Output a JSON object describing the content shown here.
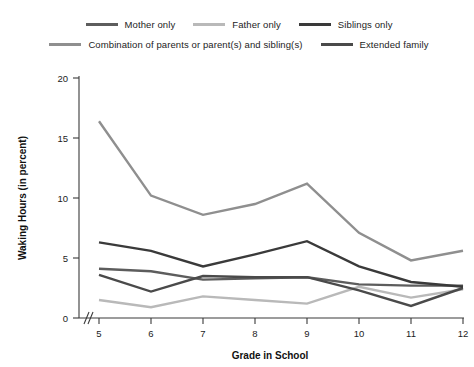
{
  "chart_data": {
    "type": "line",
    "title": "",
    "xlabel": "Grade in School",
    "ylabel": "Waking Hours (in percent)",
    "categories": [
      "5",
      "6",
      "7",
      "8",
      "9",
      "10",
      "11",
      "12"
    ],
    "x": [
      5,
      6,
      7,
      8,
      9,
      10,
      11,
      12
    ],
    "xlim": [
      5,
      12
    ],
    "ylim": [
      0,
      20
    ],
    "yticks": [
      "0",
      "5",
      "10",
      "15",
      "20"
    ],
    "ytick_values": [
      0,
      5,
      10,
      15,
      20
    ],
    "grid": false,
    "legend_position": "top",
    "axis_break": "x-axis break between origin and grade 5",
    "series": [
      {
        "name": "Mother only",
        "color": "#5d5d5d",
        "values": [
          4.1,
          3.9,
          3.2,
          3.3,
          3.4,
          2.8,
          2.7,
          2.7
        ]
      },
      {
        "name": "Father only",
        "color": "#b9b9b9",
        "values": [
          1.5,
          0.9,
          1.8,
          1.5,
          1.2,
          2.6,
          1.7,
          2.4
        ]
      },
      {
        "name": "Siblings only",
        "color": "#3a3a3a",
        "values": [
          6.3,
          5.6,
          4.3,
          5.3,
          6.4,
          4.3,
          3.0,
          2.6
        ]
      },
      {
        "name": "Combination of parents or parent(s) and sibling(s)",
        "color": "#8f8f8f",
        "values": [
          16.4,
          10.2,
          8.6,
          9.5,
          11.2,
          7.1,
          4.8,
          5.6
        ]
      },
      {
        "name": "Extended family",
        "color": "#4a4a4a",
        "values": [
          3.6,
          2.2,
          3.5,
          3.4,
          3.4,
          2.3,
          1.0,
          2.5
        ]
      }
    ]
  },
  "legend": {
    "row1": [
      {
        "label": "Mother only",
        "color": "#5d5d5d"
      },
      {
        "label": "Father only",
        "color": "#b9b9b9"
      },
      {
        "label": "Siblings only",
        "color": "#3a3a3a"
      }
    ],
    "row2": [
      {
        "label": "Combination of parents or parent(s) and sibling(s)",
        "color": "#8f8f8f"
      },
      {
        "label": "Extended family",
        "color": "#4a4a4a"
      }
    ]
  },
  "axes": {
    "x_title": "Grade in School",
    "y_title": "Waking Hours (in percent)",
    "x_ticks": [
      "5",
      "6",
      "7",
      "8",
      "9",
      "10",
      "11",
      "12"
    ],
    "y_ticks": [
      "20",
      "15",
      "10",
      "5",
      "0"
    ]
  }
}
